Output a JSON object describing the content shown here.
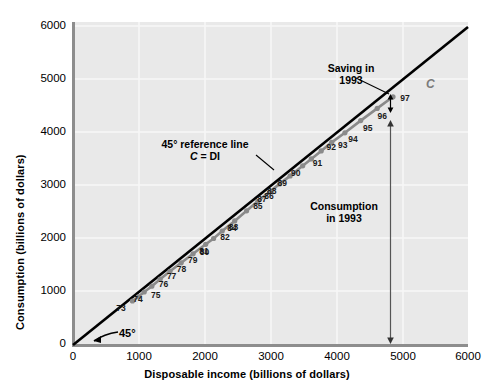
{
  "chart_data": {
    "type": "scatter",
    "title": "",
    "xlabel": "Disposable income (billions of dollars)",
    "ylabel": "Consumption (billions of dollars)",
    "xlim": [
      0,
      6000
    ],
    "ylim": [
      0,
      6000
    ],
    "xticks": [
      0,
      1000,
      2000,
      3000,
      4000,
      5000,
      6000
    ],
    "yticks": [
      0,
      1000,
      2000,
      3000,
      4000,
      5000,
      6000
    ],
    "xtick_labels": [
      "0",
      "1000",
      "2000",
      "3000",
      "4000",
      "5000",
      "6000"
    ],
    "ytick_labels": [
      "0",
      "1000",
      "2000",
      "3000",
      "4000",
      "5000",
      "6000"
    ],
    "grid": true,
    "legend_position": "none",
    "plot_bgcolor": "#e9e9e9",
    "series": [
      {
        "name": "C",
        "type": "line+markers",
        "color": "#8a8a8a",
        "point_labels": [
          "73",
          "74",
          "75",
          "76",
          "77",
          "78",
          "79",
          "80",
          "81",
          "82",
          "83",
          "84",
          "85",
          "86",
          "87",
          "88",
          "89",
          "90",
          "91",
          "92",
          "93",
          "94",
          "95",
          "96",
          "97"
        ],
        "x": [
          900,
          990,
          1080,
          1195,
          1320,
          1470,
          1640,
          1820,
          2010,
          2130,
          2260,
          2450,
          2630,
          2800,
          2980,
          3130,
          3290,
          3480,
          3610,
          3760,
          3920,
          4120,
          4360,
          4610,
          4850
        ],
        "y": [
          830,
          910,
          1000,
          1110,
          1240,
          1390,
          1550,
          1720,
          1900,
          2010,
          2150,
          2340,
          2530,
          2710,
          2890,
          3040,
          3190,
          3380,
          3510,
          3660,
          3820,
          4000,
          4230,
          4460,
          4680
        ]
      },
      {
        "name": "45-degree reference line",
        "type": "line",
        "color": "#000000",
        "x": [
          0,
          6000
        ],
        "y": [
          0,
          6000
        ]
      }
    ],
    "annotations": [
      {
        "name": "saving-1993",
        "text_line1": "Saving in",
        "text_line2": "1993"
      },
      {
        "name": "reference-line",
        "text_line1": "45° reference line",
        "text_line2_prefix": "C",
        "text_line2_suffix": " = DI"
      },
      {
        "name": "consumption-1993",
        "text_line1": "Consumption",
        "text_line2": "in 1993"
      },
      {
        "name": "angle-45",
        "text": "45°"
      },
      {
        "name": "series-c",
        "text": "C"
      }
    ]
  },
  "axes": {
    "y_title": "Consumption (billions of dollars)",
    "x_title": "Disposable income (billions of dollars)"
  },
  "labels": {
    "saving_line1": "Saving in",
    "saving_line2": "1993",
    "reference_line1": "45° reference line",
    "reference_c": "C",
    "reference_eq": " = DI",
    "consumption_line1": "Consumption",
    "consumption_line2": "in 1993",
    "angle": "45°",
    "c_symbol": "C"
  }
}
